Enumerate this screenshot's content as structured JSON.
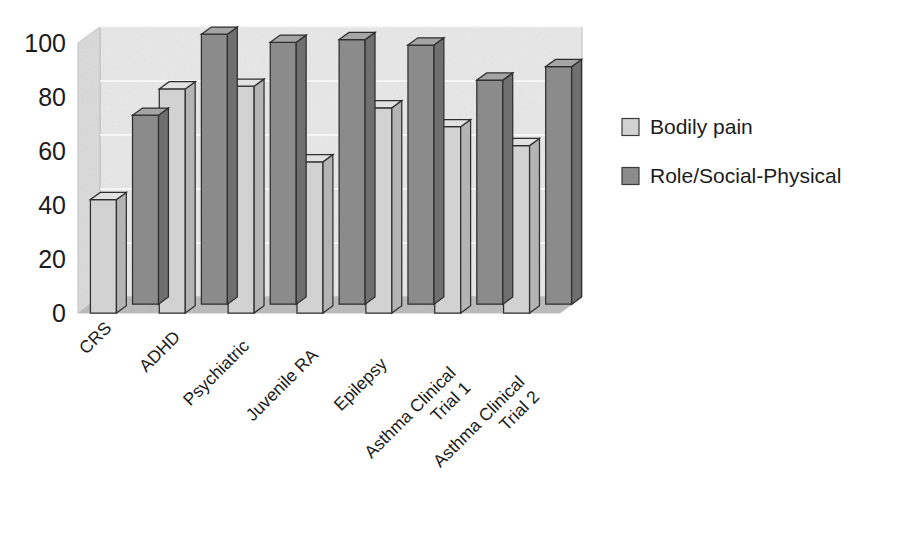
{
  "chart_data": {
    "type": "bar",
    "title": "",
    "subtitle": "",
    "xlabel": "",
    "ylabel": "",
    "ylim": [
      0,
      100
    ],
    "yticks": [
      0,
      20,
      40,
      60,
      80,
      100
    ],
    "ytick_labels": [
      "0",
      "20",
      "40",
      "60",
      "80",
      "100"
    ],
    "grid": true,
    "grid_axis": "y",
    "three_d": true,
    "legend_position": "right",
    "categories": [
      "CRS",
      "ADHD",
      "Psychiatric",
      "Juvenile RA",
      "Epilepsy",
      "Asthma Clinical Trial 1",
      "Asthma Clinical Trial 2"
    ],
    "category_lines": [
      [
        "CRS"
      ],
      [
        "ADHD"
      ],
      [
        "Psychiatric"
      ],
      [
        "Juvenile RA"
      ],
      [
        "Epilepsy"
      ],
      [
        "Asthma Clinical",
        "Trial 1"
      ],
      [
        "Asthma Clinical",
        "Trial 2"
      ]
    ],
    "series": [
      {
        "name": "Bodily pain",
        "color": "#d2d2d2",
        "side_color": "#b4b4b4",
        "top_color": "#e2e2e2",
        "values": [
          42,
          83,
          84,
          56,
          76,
          69,
          62
        ]
      },
      {
        "name": "Role/Social-Physical",
        "color": "#8b8b8b",
        "side_color": "#6f6f6f",
        "top_color": "#a5a5a5",
        "values": [
          70,
          100,
          97,
          98,
          96,
          83,
          88
        ]
      }
    ]
  },
  "legend": {
    "items": [
      {
        "label": "Bodily pain",
        "color": "#d2d2d2"
      },
      {
        "label": "Role/Social-Physical",
        "color": "#8b8b8b"
      }
    ]
  },
  "colors": {
    "back_wall": "#e9e9e9",
    "side_wall": "#dcdcdc",
    "floor": "#bdbdbd",
    "axis_text": "#1b1b1b",
    "bar_outline": "#2e2e2e",
    "gridline": "#ffffff",
    "background": "#ffffff"
  },
  "geometry": {
    "plot_left": 78,
    "plot_right": 560,
    "value_top_y": 43,
    "value_zero_y": 313,
    "depth_dx": 22,
    "depth_dy": -16,
    "group_count": 7,
    "bar_width": 26
  }
}
